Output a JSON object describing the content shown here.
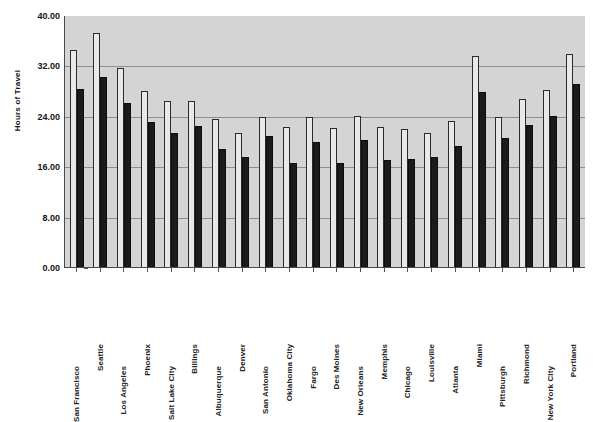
{
  "chart_data": {
    "type": "bar",
    "title": "",
    "xlabel": "",
    "ylabel": "Hours of Travel",
    "ylim": [
      0,
      40
    ],
    "ytick_labels": [
      "40.00",
      "32.00",
      "24.00",
      "16.00",
      "8.00",
      "0.00"
    ],
    "ytick_values": [
      40,
      32,
      24,
      16,
      8,
      0
    ],
    "grid": true,
    "legend_position": "none",
    "categories": [
      "San Francisco",
      "Seattle",
      "Los Angeles",
      "Phoenix",
      "Salt Lake City",
      "Billings",
      "Albuquerque",
      "Denver",
      "San Antonio",
      "Oklahoma City",
      "Fargo",
      "Des Moines",
      "New Orleans",
      "Memphis",
      "Chicago",
      "Louisville",
      "Atlanta",
      "Miami",
      "Pittsburgh",
      "Richmond",
      "New York City",
      "Portland"
    ],
    "series": [
      {
        "name": "Series 1",
        "color": "#e8e8e8",
        "values": [
          34.4,
          37.1,
          31.6,
          28.0,
          26.4,
          26.4,
          23.5,
          21.2,
          23.8,
          22.3,
          23.8,
          22.1,
          24.0,
          22.3,
          21.9,
          21.2,
          23.1,
          33.5,
          23.8,
          26.6,
          28.1,
          33.8
        ]
      },
      {
        "name": "Series 2",
        "color": "#1b1b1b",
        "values": [
          28.3,
          30.2,
          26.0,
          23.0,
          21.2,
          22.4,
          18.8,
          17.4,
          20.8,
          16.5,
          19.8,
          16.5,
          20.1,
          17.0,
          17.2,
          17.4,
          19.2,
          27.8,
          20.4,
          22.5,
          23.9,
          29.0
        ]
      }
    ],
    "label_rows": [
      1,
      0,
      1,
      0,
      1,
      0,
      1,
      0,
      1,
      0,
      1,
      0,
      1,
      0,
      1,
      0,
      1,
      0,
      1,
      0,
      1,
      0
    ]
  }
}
